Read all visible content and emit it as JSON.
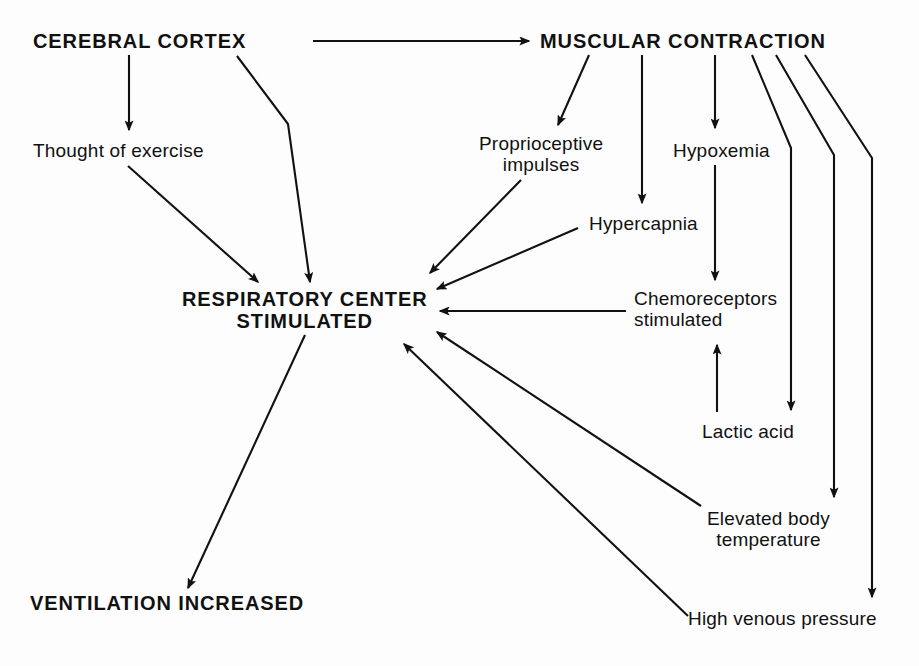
{
  "diagram": {
    "background_color": "#fdfdfd",
    "ink_color": "#111111",
    "nodes": [
      {
        "id": "cerebral-cortex",
        "label": "CEREBRAL CORTEX",
        "style": "bold",
        "x": 33,
        "y": 30,
        "align": "left"
      },
      {
        "id": "muscular-contraction",
        "label": "MUSCULAR CONTRACTION",
        "style": "bold",
        "x": 540,
        "y": 30,
        "align": "left"
      },
      {
        "id": "thought-of-exercise",
        "label": "Thought of exercise",
        "style": "plain",
        "x": 33,
        "y": 140,
        "align": "left"
      },
      {
        "id": "proprioceptive-impulses",
        "label": "Proprioceptive\nimpulses",
        "style": "plain",
        "x": 479,
        "y": 133,
        "align": "center"
      },
      {
        "id": "hypoxemia",
        "label": "Hypoxemia",
        "style": "plain",
        "x": 673,
        "y": 140,
        "align": "left"
      },
      {
        "id": "hypercapnia",
        "label": "Hypercapnia",
        "style": "plain",
        "x": 589,
        "y": 213,
        "align": "left"
      },
      {
        "id": "respiratory-center",
        "label": "RESPIRATORY CENTER\nSTIMULATED",
        "style": "bold",
        "x": 182,
        "y": 288,
        "align": "center"
      },
      {
        "id": "chemoreceptors",
        "label": "Chemoreceptors\nstimulated",
        "style": "plain",
        "x": 634,
        "y": 288,
        "align": "left"
      },
      {
        "id": "lactic-acid",
        "label": "Lactic acid",
        "style": "plain",
        "x": 702,
        "y": 421,
        "align": "left"
      },
      {
        "id": "elevated-body-temperature",
        "label": "Elevated body\ntemperature",
        "style": "plain",
        "x": 707,
        "y": 508,
        "align": "center"
      },
      {
        "id": "high-venous-pressure",
        "label": "High venous pressure",
        "style": "plain",
        "x": 688,
        "y": 608,
        "align": "left"
      },
      {
        "id": "ventilation-increased",
        "label": "VENTILATION INCREASED",
        "style": "bold",
        "x": 30,
        "y": 592,
        "align": "left"
      }
    ],
    "edges": [
      {
        "id": "cortex-to-muscular",
        "from": "cerebral-cortex",
        "to": "muscular-contraction",
        "kind": "arrow",
        "path": "M 313 41 L 529 41"
      },
      {
        "id": "cortex-to-thought",
        "from": "cerebral-cortex",
        "to": "thought-of-exercise",
        "kind": "arrow",
        "path": "M 129 55 L 129 130"
      },
      {
        "id": "cortex-to-respiratory",
        "from": "cerebral-cortex",
        "to": "respiratory-center",
        "kind": "arrow",
        "path": "M 237 56 L 288 124 L 310 282"
      },
      {
        "id": "thought-to-respiratory",
        "from": "thought-of-exercise",
        "to": "respiratory-center",
        "kind": "arrow",
        "path": "M 128 166 L 258 282"
      },
      {
        "id": "muscular-to-proprioceptive",
        "from": "muscular-contraction",
        "to": "proprioceptive-impulses",
        "kind": "arrow",
        "path": "M 589 55 L 558 125"
      },
      {
        "id": "muscular-to-hypercapnia",
        "from": "muscular-contraction",
        "to": "hypercapnia",
        "kind": "arrow",
        "path": "M 642 55 L 642 203"
      },
      {
        "id": "muscular-to-hypoxemia",
        "from": "muscular-contraction",
        "to": "hypoxemia",
        "kind": "arrow",
        "path": "M 715 55 L 715 128"
      },
      {
        "id": "muscular-to-lactic-acid",
        "from": "muscular-contraction",
        "to": "lactic-acid",
        "kind": "arrow",
        "path": "M 752 55 L 791 148 L 791 410"
      },
      {
        "id": "muscular-to-body-temp",
        "from": "muscular-contraction",
        "to": "elevated-body-temperature",
        "kind": "arrow",
        "path": "M 776 55 L 834 155 L 834 497"
      },
      {
        "id": "muscular-to-venous",
        "from": "muscular-contraction",
        "to": "high-venous-pressure",
        "kind": "arrow",
        "path": "M 805 55 L 872 158 L 872 597"
      },
      {
        "id": "hypoxemia-to-chemoreceptors",
        "from": "hypoxemia",
        "to": "chemoreceptors",
        "kind": "arrow",
        "path": "M 715 165 L 715 280"
      },
      {
        "id": "lactic-acid-to-chemoreceptors",
        "from": "lactic-acid",
        "to": "chemoreceptors",
        "kind": "arrow",
        "path": "M 717 412 L 717 345"
      },
      {
        "id": "proprioceptive-to-respiratory",
        "from": "proprioceptive-impulses",
        "to": "respiratory-center",
        "kind": "arrow",
        "path": "M 521 180 L 430 273"
      },
      {
        "id": "hypercapnia-to-respiratory",
        "from": "hypercapnia",
        "to": "respiratory-center",
        "kind": "arrow",
        "path": "M 578 228 L 437 289"
      },
      {
        "id": "chemoreceptors-to-respiratory",
        "from": "chemoreceptors",
        "to": "respiratory-center",
        "kind": "arrow",
        "path": "M 626 311 L 440 311"
      },
      {
        "id": "body-temp-to-respiratory",
        "from": "elevated-body-temperature",
        "to": "respiratory-center",
        "kind": "arrow",
        "path": "M 701 506 L 437 332"
      },
      {
        "id": "venous-to-respiratory",
        "from": "high-venous-pressure",
        "to": "respiratory-center",
        "kind": "arrow",
        "path": "M 688 616 L 404 344"
      },
      {
        "id": "respiratory-to-ventilation",
        "from": "respiratory-center",
        "to": "ventilation-increased",
        "kind": "arrow",
        "path": "M 305 335 L 188 588"
      }
    ],
    "caption": ""
  }
}
